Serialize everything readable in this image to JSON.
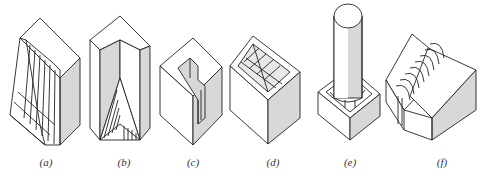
{
  "figure": {
    "panels": [
      {
        "id": "a",
        "label": "(a)",
        "center_x": 46,
        "description": "block with stepped hatched recess"
      },
      {
        "id": "b",
        "label": "(b)",
        "center_x": 124,
        "description": "hexagonal prism with V groove"
      },
      {
        "id": "c",
        "label": "(c)",
        "center_x": 193,
        "description": "block with L-shaped slot"
      },
      {
        "id": "d",
        "label": "(d)",
        "center_x": 273,
        "description": "block with grid pocket"
      },
      {
        "id": "e",
        "label": "(e)",
        "center_x": 350,
        "description": "cylinder standing on square base with fillet"
      },
      {
        "id": "f",
        "label": "(f)",
        "center_x": 442,
        "description": "block with semicircular channel"
      }
    ]
  },
  "colors": {
    "line": "#222222",
    "shade": "#bdbdbd",
    "background": "#ffffff"
  }
}
